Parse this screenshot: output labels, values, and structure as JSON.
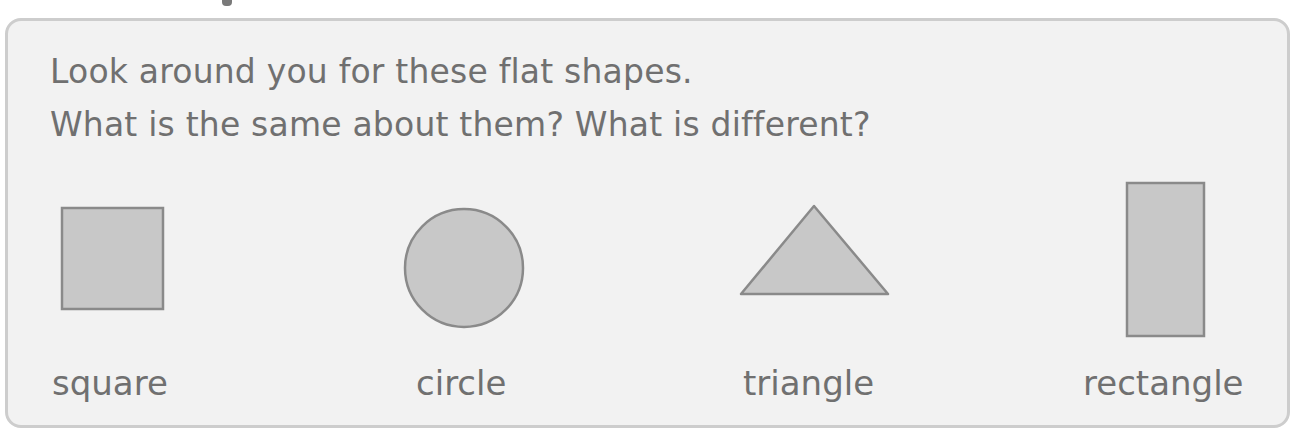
{
  "instructions": {
    "line1": "Look around you for these flat shapes.",
    "line2": "What is the same about them? What is different?"
  },
  "shapes": [
    {
      "name": "square",
      "label": "square"
    },
    {
      "name": "circle",
      "label": "circle"
    },
    {
      "name": "triangle",
      "label": "triangle"
    },
    {
      "name": "rectangle",
      "label": "rectangle"
    }
  ],
  "colors": {
    "shape_fill": "#c8c8c8",
    "shape_stroke": "#8a8a8a",
    "panel_bg": "#f2f2f2",
    "panel_border": "#cdcdcd",
    "text": "#707070"
  }
}
